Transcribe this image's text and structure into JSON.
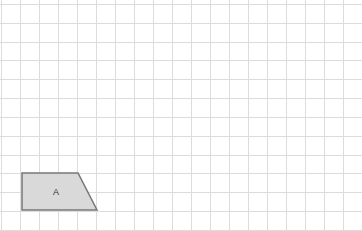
{
  "grid": {
    "origin_x": 1,
    "origin_y": 4,
    "cell_width": 19,
    "cell_height": 18.82,
    "columns": 19,
    "rows": 12,
    "line_color": "#dcdcdc",
    "background": "#ffffff"
  },
  "shapes": [
    {
      "name": "A",
      "label": "A",
      "type": "trapezoid",
      "vertices_px": [
        [
          22,
          173
        ],
        [
          78,
          173
        ],
        [
          97,
          210
        ],
        [
          22,
          210
        ]
      ],
      "vertices_grid": [
        [
          1,
          9
        ],
        [
          4,
          9
        ],
        [
          5,
          11
        ],
        [
          1,
          11
        ]
      ],
      "label_pos_px": [
        56,
        193
      ],
      "fill": "#d9d9d9",
      "stroke": "#777777"
    }
  ]
}
